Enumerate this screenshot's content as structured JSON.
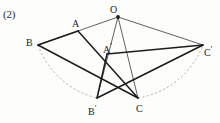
{
  "page": {
    "item_number": "(2)",
    "cutoff_line": {
      "visible": true,
      "text": "①  ——  ——  ——   —",
      "circled_marker": "①"
    },
    "background_color": "#fdfdfc",
    "ink_color": "#1c1c1c"
  },
  "figure": {
    "name": "rotation-geometry-figure",
    "center_point_label": "O",
    "vertices": [
      {
        "id": "O",
        "label": "O",
        "label_primed": false,
        "x": 118,
        "y": 17,
        "lx": 110,
        "ly": 5,
        "dot": true
      },
      {
        "id": "A",
        "label": "A",
        "label_primed": false,
        "x": 78,
        "y": 31,
        "lx": 72,
        "ly": 19,
        "dot": false
      },
      {
        "id": "B",
        "label": "B",
        "label_primed": false,
        "x": 38,
        "y": 45,
        "lx": 26,
        "ly": 38,
        "dot": false
      },
      {
        "id": "C",
        "label": "C",
        "label_primed": false,
        "x": 138,
        "y": 98,
        "lx": 136,
        "ly": 104,
        "dot": false
      },
      {
        "id": "A1",
        "label": "A",
        "label_primed": true,
        "x": 107,
        "y": 54,
        "lx": 103,
        "ly": 42,
        "dot": false
      },
      {
        "id": "B1",
        "label": "B",
        "label_primed": true,
        "x": 97,
        "y": 98,
        "lx": 88,
        "ly": 104,
        "dot": false
      },
      {
        "id": "C1",
        "label": "C",
        "label_primed": true,
        "x": 203,
        "y": 45,
        "lx": 204,
        "ly": 45,
        "dot": false
      }
    ],
    "segments": [
      {
        "name": "seg-O-B",
        "from": "O",
        "to": "B",
        "weight": "thin",
        "style": "solid"
      },
      {
        "name": "seg-O-C1",
        "from": "O",
        "to": "C1",
        "weight": "thin",
        "style": "solid"
      },
      {
        "name": "seg-O-B1",
        "from": "O",
        "to": "B1",
        "weight": "thin",
        "style": "solid"
      },
      {
        "name": "seg-O-C",
        "from": "O",
        "to": "C",
        "weight": "thin",
        "style": "solid"
      },
      {
        "name": "seg-B-A",
        "from": "B",
        "to": "A",
        "weight": "thick",
        "style": "solid"
      },
      {
        "name": "seg-B-C",
        "from": "B",
        "to": "C",
        "weight": "thick",
        "style": "solid"
      },
      {
        "name": "seg-A-C",
        "from": "A",
        "to": "C",
        "weight": "thick",
        "style": "solid"
      },
      {
        "name": "seg-A1-B1",
        "from": "A1",
        "to": "B1",
        "weight": "thick",
        "style": "solid"
      },
      {
        "name": "seg-A1-C1",
        "from": "A1",
        "to": "C1",
        "weight": "thick",
        "style": "solid"
      },
      {
        "name": "seg-B1-C1",
        "from": "B1",
        "to": "C1",
        "weight": "thick",
        "style": "solid"
      }
    ],
    "arcs": [
      {
        "name": "arc-B-to-B1",
        "from": "B",
        "to": "B1",
        "style": "dashed",
        "sweep": "clockwise",
        "radius": 84
      },
      {
        "name": "arc-C-to-C1",
        "from": "C",
        "to": "C1",
        "style": "dashed",
        "sweep": "clockwise",
        "radius": 84
      }
    ]
  }
}
